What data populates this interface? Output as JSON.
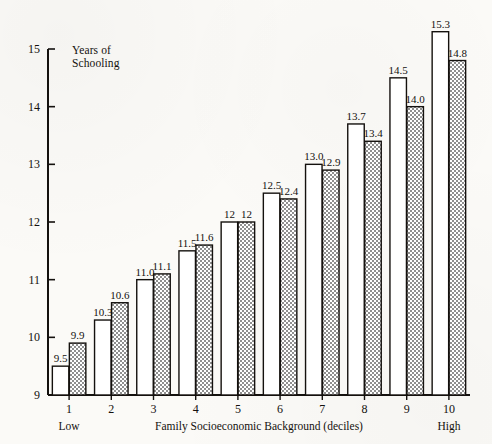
{
  "chart_data": {
    "type": "bar",
    "title": "",
    "xlabel": "Family Socioeconomic Background (deciles)",
    "ylabel": "Years of\nSchooling",
    "categories": [
      "1",
      "2",
      "3",
      "4",
      "5",
      "6",
      "7",
      "8",
      "9",
      "10"
    ],
    "x_end_labels": {
      "low": "Low",
      "high": "High"
    },
    "ylim": [
      9,
      15
    ],
    "yticks": [
      "9",
      "10",
      "11",
      "12",
      "13",
      "14",
      "15"
    ],
    "ytick_values": [
      9,
      10,
      11,
      12,
      13,
      14,
      15
    ],
    "grid": false,
    "legend": "none",
    "series": [
      {
        "name": "series-a",
        "fill": "white",
        "values": [
          9.5,
          10.3,
          11.0,
          11.5,
          12.0,
          12.5,
          13.0,
          13.7,
          14.5,
          15.3
        ],
        "labels": [
          "9.5",
          "10.3",
          "11.0",
          "11.5",
          "12",
          "12.5",
          "13.0",
          "13.7",
          "14.5",
          "15.3"
        ]
      },
      {
        "name": "series-b",
        "fill": "hatched-gray",
        "values": [
          9.9,
          10.6,
          11.1,
          11.6,
          12.0,
          12.4,
          12.9,
          13.4,
          14.0,
          14.8
        ],
        "labels": [
          "9.9",
          "10.6",
          "11.1",
          "11.6",
          "12",
          "12.4",
          "12.9",
          "13.4",
          "14.0",
          "14.8"
        ]
      }
    ]
  },
  "colors": {
    "ink": "#14110e",
    "paper": "#fbfaf7",
    "bar_white": "#ffffff",
    "bar_shaded": "#b7b7b7"
  }
}
